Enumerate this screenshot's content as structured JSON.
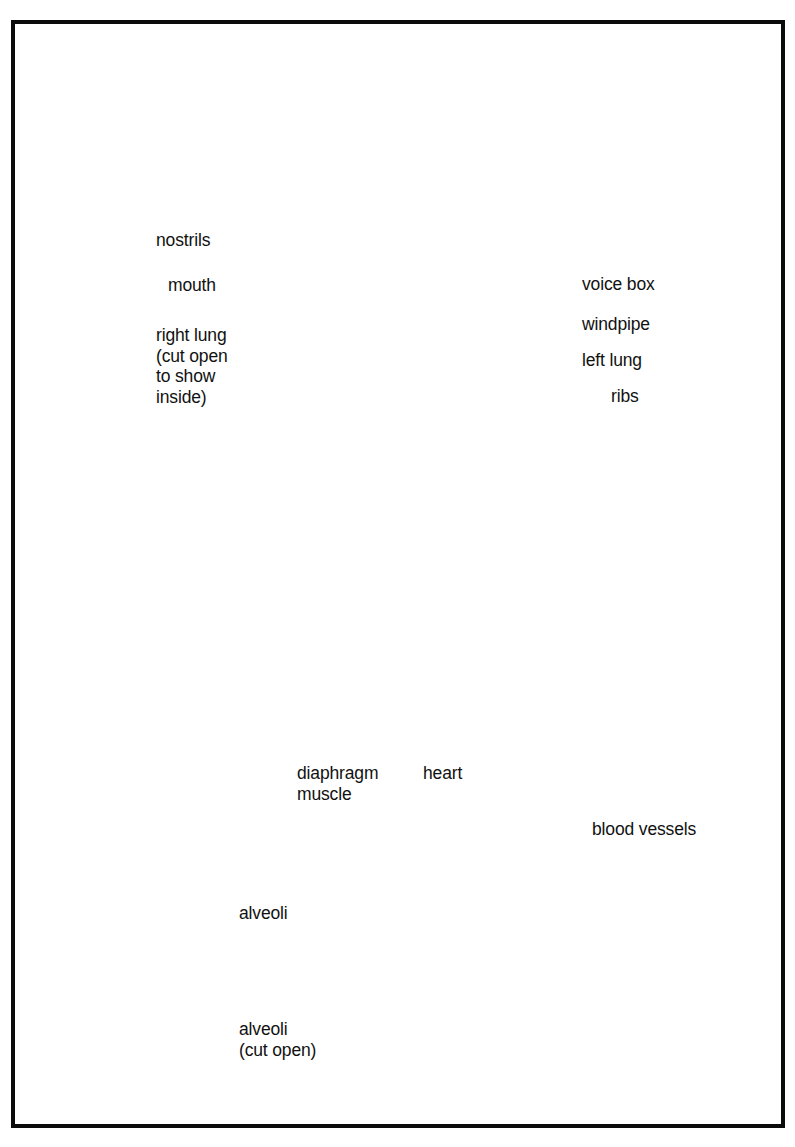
{
  "figure": {
    "frame_color": "#0b0b0b",
    "background": "#ffffff"
  },
  "palette": {
    "skin": "#f6eedb",
    "skin_shade": "#e8dcc2",
    "skin_outline": "#b9a98c",
    "nasal_passage": "#b5793f",
    "nasal_passage_dark": "#8d5526",
    "right_lung": "#e08e66",
    "right_lung_dark": "#c0714b",
    "left_lung": "#a49484",
    "left_lung_dark": "#857565",
    "heart": "#b87f72",
    "heart_fat": "#eddcb4",
    "rib_bone": "#fbf6e6",
    "rib_outline": "#7c6a50",
    "trachea": "#dcd8c6",
    "aorta": "#b8c4d2",
    "artery_red": "#cf3b2e",
    "vein_blue": "#7b93c4",
    "alveoli": "#efe6cc",
    "alveoli_open": "#cf8655",
    "line": "#111111",
    "text": "#111111"
  },
  "labels": {
    "left": [
      {
        "id": "nostrils",
        "text": "nostrils",
        "x": 156,
        "y": 230
      },
      {
        "id": "mouth",
        "text": "mouth",
        "x": 168,
        "y": 275
      },
      {
        "id": "right_lung",
        "text": "right lung\n(cut open\nto show\ninside)",
        "x": 156,
        "y": 325
      },
      {
        "id": "diaphragm",
        "text": "diaphragm\nmuscle",
        "x": 297,
        "y": 763
      },
      {
        "id": "heart",
        "text": "heart",
        "x": 423,
        "y": 763
      },
      {
        "id": "alveoli",
        "text": "alveoli",
        "x": 239,
        "y": 916
      },
      {
        "id": "alveoli_cut",
        "text": "alveoli\n(cut open)",
        "x": 239,
        "y": 1032
      }
    ],
    "right": [
      {
        "id": "voice_box",
        "text": "voice box",
        "x": 582,
        "y": 283
      },
      {
        "id": "windpipe",
        "text": "windpipe",
        "x": 582,
        "y": 323
      },
      {
        "id": "left_lung",
        "text": "left lung",
        "x": 582,
        "y": 359
      },
      {
        "id": "ribs",
        "text": "ribs",
        "x": 611,
        "y": 394
      },
      {
        "id": "blood_vessels",
        "text": "blood vessels",
        "x": 592,
        "y": 828
      }
    ]
  },
  "anatomy_parts": [
    "nostrils",
    "mouth",
    "right lung (cut open to show inside)",
    "voice box",
    "windpipe",
    "left lung",
    "ribs",
    "diaphragm muscle",
    "heart",
    "alveoli",
    "alveoli (cut open)",
    "blood vessels"
  ],
  "detail_circle": {
    "center_x": 498,
    "center_y": 966,
    "radius": 152,
    "contents": [
      "alveoli",
      "alveoli (cut open)",
      "blood vessels",
      "bronchiole"
    ]
  }
}
